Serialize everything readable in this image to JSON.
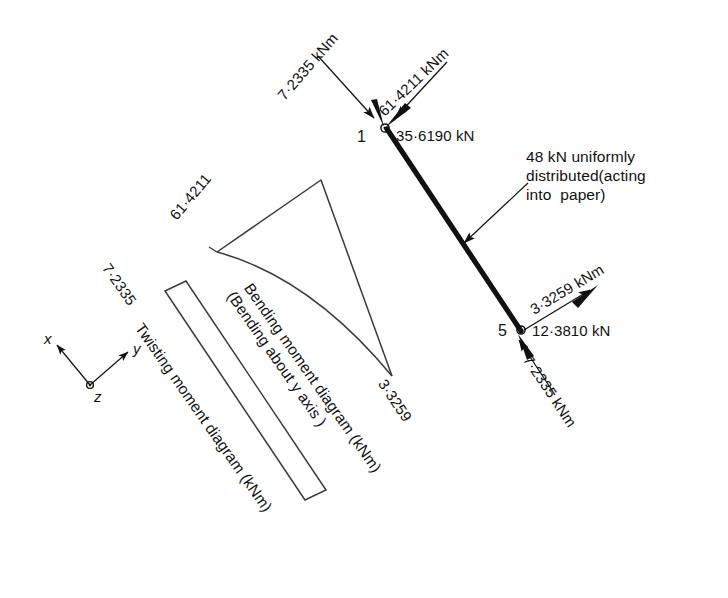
{
  "figure": {
    "type": "structural-engineering-diagram",
    "ink_color": "#111111",
    "background_color": "#ffffff",
    "nodes": [
      {
        "id": "1",
        "label": "1"
      },
      {
        "id": "5",
        "label": "5"
      }
    ],
    "node_1_labels": {
      "moment_left": "7·2335 kNm",
      "moment_right": "61·4211 kNm",
      "force": "35·6190 kN"
    },
    "node_5_labels": {
      "moment_upper": "3·3259 kNm",
      "force": "12·3810 kN",
      "moment_lower": "7·2335 kNm"
    },
    "load_note": {
      "line1": "48 kN uniformly",
      "line2": "distributed(acting",
      "line3": "into  paper)"
    },
    "bending_moment_diagram": {
      "caption_line1": "Bending moment diagram (kNm)",
      "caption_line2": "(Bending about y axis )",
      "value_start": "61·4211",
      "value_end": "3·3259"
    },
    "twisting_moment_diagram": {
      "caption": "Twisting moment diagram (kNm)",
      "value": "7·2335"
    },
    "axis_triad": {
      "x_label": "x",
      "y_label": "y",
      "z_label": "z"
    }
  }
}
